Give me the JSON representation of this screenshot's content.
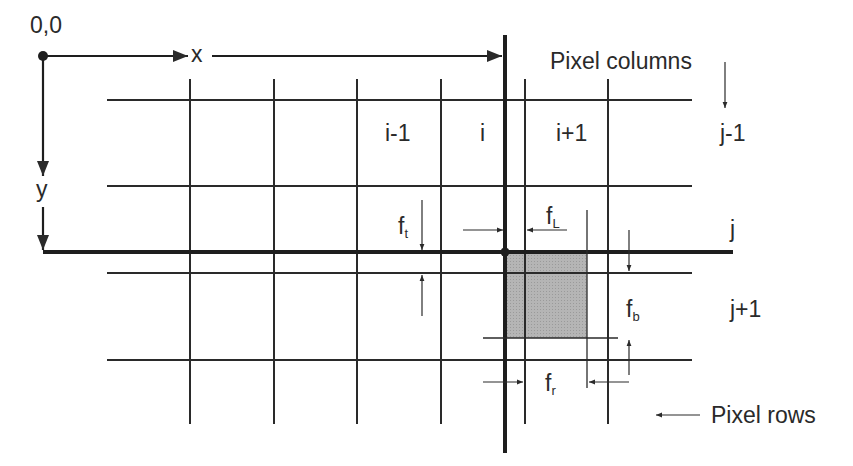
{
  "diagram": {
    "origin_label": "0,0",
    "x_axis_label": "x",
    "y_axis_label": "y",
    "column_labels": [
      "i-1",
      "i",
      "i+1"
    ],
    "row_labels": [
      "j-1",
      "j",
      "j+1"
    ],
    "pixel_columns_label": "Pixel columns",
    "pixel_rows_label": "Pixel rows",
    "offsets": {
      "ft": {
        "base": "f",
        "sub": "t"
      },
      "fL": {
        "base": "f",
        "sub": "L"
      },
      "fb": {
        "base": "f",
        "sub": "b"
      },
      "fr": {
        "base": "f",
        "sub": "r"
      }
    },
    "colors": {
      "line": "#2a2a2a",
      "shaded_pixel": "#b5b5b5"
    }
  }
}
